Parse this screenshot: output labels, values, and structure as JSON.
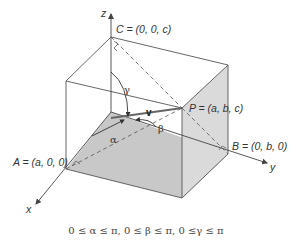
{
  "diagram": {
    "axes": {
      "x": "x",
      "y": "y",
      "z": "z"
    },
    "points": {
      "A": "A = (a, 0, 0)",
      "B": "B = (0, b, 0)",
      "C": "C = (0, 0, c)",
      "P": "P = (a, b, c)"
    },
    "vector_label": "v",
    "angles": {
      "alpha": "α",
      "beta": "β",
      "gamma": "γ"
    },
    "caption": "0 ≤ α ≤ π, 0 ≤ β ≤ π, 0 ≤γ ≤ π",
    "colors": {
      "line": "#555555",
      "bottom_face": "#c4c4c4",
      "right_face": "#d4d4d4",
      "front_face": "#e6e6e6",
      "vector": "#666666"
    }
  }
}
